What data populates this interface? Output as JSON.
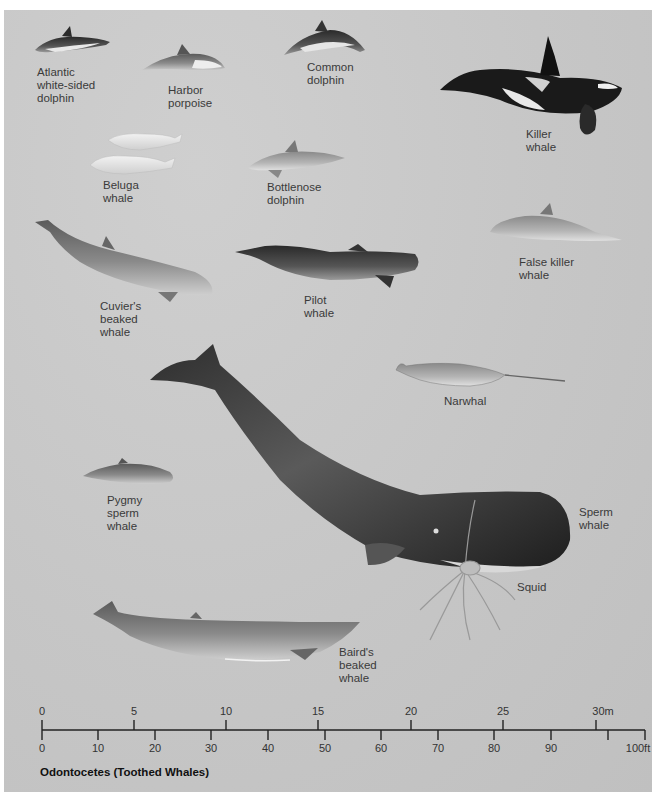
{
  "figure": {
    "title": "Odontocetes (Toothed Whales)",
    "background_color": "#c6c6c6"
  },
  "species": [
    {
      "id": "atlantic_white_sided_dolphin",
      "label": "Atlantic\nwhite-sided\ndolphin"
    },
    {
      "id": "harbor_porpoise",
      "label": "Harbor\nporpoise"
    },
    {
      "id": "common_dolphin",
      "label": "Common\ndolphin"
    },
    {
      "id": "killer_whale",
      "label": "Killer\nwhale"
    },
    {
      "id": "beluga_whale",
      "label": "Beluga\nwhale"
    },
    {
      "id": "bottlenose_dolphin",
      "label": "Bottlenose\ndolphin"
    },
    {
      "id": "false_killer_whale",
      "label": "False killer\nwhale"
    },
    {
      "id": "cuviers_beaked_whale",
      "label": "Cuvier's\nbeaked\nwhale"
    },
    {
      "id": "pilot_whale",
      "label": "Pilot\nwhale"
    },
    {
      "id": "narwhal",
      "label": "Narwhal"
    },
    {
      "id": "pygmy_sperm_whale",
      "label": "Pygmy\nsperm\nwhale"
    },
    {
      "id": "sperm_whale",
      "label": "Sperm\nwhale"
    },
    {
      "id": "squid",
      "label": "Squid"
    },
    {
      "id": "bairds_beaked_whale",
      "label": "Baird's\nbeaked\nwhale"
    }
  ],
  "scale": {
    "meters": {
      "unit": "m",
      "ticks": [
        "0",
        "5",
        "10",
        "15",
        "20",
        "25",
        "30m"
      ]
    },
    "feet": {
      "unit": "ft",
      "ticks": [
        "0",
        "10",
        "20",
        "30",
        "40",
        "50",
        "60",
        "70",
        "80",
        "90",
        "100ft"
      ]
    }
  }
}
